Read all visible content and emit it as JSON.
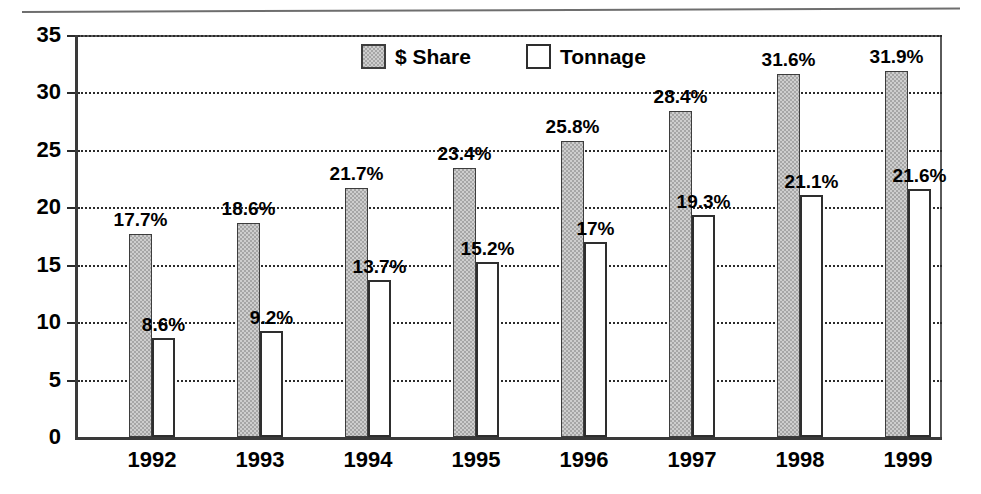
{
  "chart_data": {
    "type": "bar",
    "title": "",
    "xlabel": "",
    "ylabel": "",
    "ylim": [
      0,
      35
    ],
    "yticks": [
      "0",
      "5",
      "10",
      "15",
      "20",
      "25",
      "30",
      "35"
    ],
    "grid": true,
    "legend_position": "top-center",
    "categories": [
      "1992",
      "1993",
      "1994",
      "1995",
      "1996",
      "1997",
      "1998",
      "1999"
    ],
    "series": [
      {
        "name": "$ Share",
        "color": "#a6a6a6",
        "values": [
          17.7,
          18.6,
          21.7,
          23.4,
          25.8,
          28.4,
          31.6,
          31.9
        ],
        "labels": [
          "17.7%",
          "18.6%",
          "21.7%",
          "23.4%",
          "25.8%",
          "28.4%",
          "31.6%",
          "31.9%"
        ]
      },
      {
        "name": "Tonnage",
        "color": "#ffffff",
        "values": [
          8.6,
          9.2,
          13.7,
          15.2,
          17,
          19.3,
          21.1,
          21.6
        ],
        "labels": [
          "8.6%",
          "9.2%",
          "13.7%",
          "15.2%",
          "17%",
          "19.3%",
          "21.1%",
          "21.6%"
        ]
      }
    ]
  },
  "legend": {
    "items": [
      {
        "label": "$ Share",
        "swatch": "filled-gray-swatch"
      },
      {
        "label": "Tonnage",
        "swatch": "outlined-white-swatch"
      }
    ]
  }
}
